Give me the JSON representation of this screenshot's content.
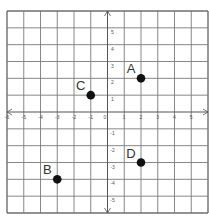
{
  "diagram": {
    "type": "coordinate-plane",
    "x_range": [
      -6,
      6
    ],
    "y_range": [
      -6,
      6
    ],
    "grid_step": 1,
    "x_tick_labels": [
      {
        "value": -6,
        "label": "-6"
      },
      {
        "value": -5,
        "label": "-5"
      },
      {
        "value": -4,
        "label": "-4"
      },
      {
        "value": -3,
        "label": "-3"
      },
      {
        "value": -2,
        "label": "-2"
      },
      {
        "value": -1,
        "label": "-1"
      },
      {
        "value": 0,
        "label": "0"
      },
      {
        "value": 1,
        "label": "1"
      },
      {
        "value": 2,
        "label": "2"
      },
      {
        "value": 3,
        "label": "3"
      },
      {
        "value": 4,
        "label": "4"
      },
      {
        "value": 5,
        "label": "5"
      }
    ],
    "y_tick_labels": [
      {
        "value": 5,
        "label": "5"
      },
      {
        "value": 4,
        "label": "4"
      },
      {
        "value": 3,
        "label": "3"
      },
      {
        "value": 2,
        "label": "2"
      },
      {
        "value": 1,
        "label": "1"
      },
      {
        "value": -1,
        "label": "-1"
      },
      {
        "value": -2,
        "label": "-2"
      },
      {
        "value": -3,
        "label": "-3"
      },
      {
        "value": -4,
        "label": "-4"
      },
      {
        "value": -5,
        "label": "-5"
      }
    ],
    "points": [
      {
        "name": "A",
        "x": 2,
        "y": 2
      },
      {
        "name": "B",
        "x": -3,
        "y": -4
      },
      {
        "name": "C",
        "x": -1,
        "y": 1
      },
      {
        "name": "D",
        "x": 2,
        "y": -3
      }
    ],
    "colors": {
      "grid": "#7a7a7a",
      "border": "#6e6e6e",
      "axis": "#555555",
      "point": "#111111",
      "label": "#333333",
      "background": "#ffffff"
    }
  }
}
